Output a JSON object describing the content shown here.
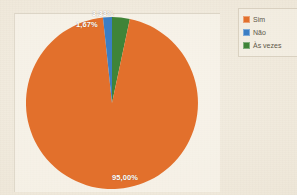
{
  "chart_data": {
    "type": "pie",
    "title": "",
    "subtitle": "",
    "xlabel": "",
    "ylabel": "",
    "grid": false,
    "legend_position": "right",
    "start_angle_deg": 0,
    "direction": "clockwise",
    "categories": [
      "Sim",
      "Não",
      "Às vezes"
    ],
    "values": [
      95.0,
      1.67,
      3.33
    ],
    "value_labels": [
      "95,00%",
      "1,67%",
      "3,33%"
    ],
    "colors": [
      "#e2702c",
      "#3b7ec4",
      "#3f8438"
    ],
    "unit": "%",
    "total": 100.0,
    "slices": [
      {
        "label": "Sim",
        "value": 95.0,
        "display": "95,00%",
        "color": "#e2702c"
      },
      {
        "label": "Não",
        "value": 1.67,
        "display": "1,67%",
        "color": "#3b7ec4"
      },
      {
        "label": "Às vezes",
        "value": 3.33,
        "display": "3,33%",
        "color": "#3f8438"
      }
    ]
  },
  "chart": {
    "labels": {
      "asvezes": "3,33%",
      "nao": "1,67%",
      "sim": "95,00%"
    }
  },
  "legend": {
    "items": [
      {
        "label": "Sim",
        "color": "#e2702c"
      },
      {
        "label": "Não",
        "color": "#3b7ec4"
      },
      {
        "label": "Às vezes",
        "color": "#3f8438"
      }
    ]
  },
  "colors": {
    "sim": "#e2702c",
    "nao": "#3b7ec4",
    "asvezes": "#3f8438",
    "background": "#efe9dc",
    "label_text": "#ffffff",
    "legend_text": "#5d5748"
  }
}
